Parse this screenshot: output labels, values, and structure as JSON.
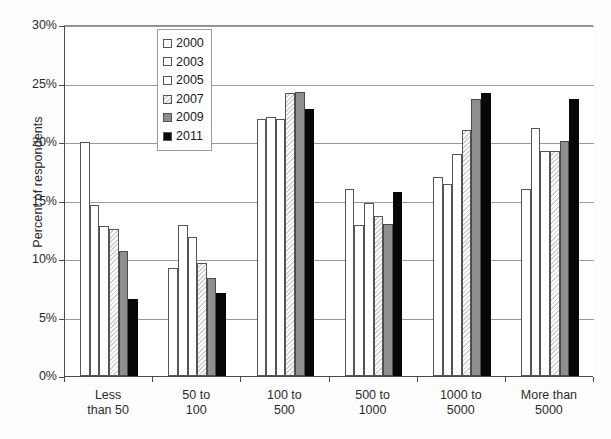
{
  "chart_data": {
    "type": "bar",
    "title": "",
    "subtitle": "",
    "xlabel": "",
    "ylabel": "Percent of respondents",
    "ylim": [
      0,
      30
    ],
    "ytick_labels": [
      "30%",
      "25%",
      "20%",
      "15%",
      "10%",
      "5%",
      "0%"
    ],
    "ytick_values": [
      30,
      25,
      20,
      15,
      10,
      5,
      0
    ],
    "grid": true,
    "legend_position": "top-left-inside",
    "categories": [
      "Less than 50",
      "50 to 100",
      "100 to 500",
      "500 to 1000",
      "1000 to 5000",
      "More than 5000"
    ],
    "category_lines": [
      [
        "Less",
        "than 50"
      ],
      [
        "50 to",
        "100"
      ],
      [
        "100 to",
        "500"
      ],
      [
        "500 to",
        "1000"
      ],
      [
        "1000 to",
        "5000"
      ],
      [
        "More than",
        "5000"
      ]
    ],
    "series": [
      {
        "name": "2000",
        "fill": "white",
        "color": "#ffffff",
        "values": [
          20.0,
          9.2,
          22.0,
          16.0,
          17.0,
          16.0
        ]
      },
      {
        "name": "2003",
        "fill": "white",
        "color": "#ffffff",
        "values": [
          14.6,
          12.9,
          22.1,
          12.9,
          16.4,
          21.2
        ]
      },
      {
        "name": "2005",
        "fill": "white",
        "color": "#ffffff",
        "values": [
          12.8,
          11.9,
          22.0,
          14.8,
          19.0,
          19.2
        ]
      },
      {
        "name": "2007",
        "fill": "light-hatch",
        "color": "#e8e8e8",
        "values": [
          12.6,
          9.7,
          24.2,
          13.7,
          21.0,
          19.2
        ]
      },
      {
        "name": "2009",
        "fill": "gray",
        "color": "#8e8e8e",
        "values": [
          10.7,
          8.4,
          24.3,
          13.0,
          23.7,
          20.1
        ]
      },
      {
        "name": "2011",
        "fill": "black",
        "color": "#070707",
        "values": [
          6.6,
          7.1,
          22.8,
          15.7,
          24.2,
          23.7
        ]
      }
    ]
  },
  "legend": {
    "items": [
      {
        "label": "2000"
      },
      {
        "label": "2003"
      },
      {
        "label": "2005"
      },
      {
        "label": "2007"
      },
      {
        "label": "2009"
      },
      {
        "label": "2011"
      }
    ]
  }
}
